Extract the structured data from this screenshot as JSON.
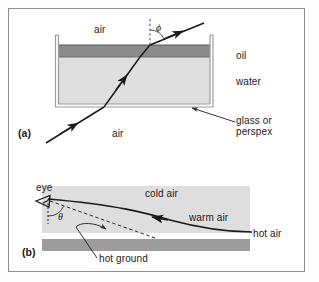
{
  "figure": {
    "panels": [
      {
        "id": "a",
        "panel_label": "(a)",
        "title_hidden": "",
        "labels": {
          "air_top": "air",
          "air_bottom": "air",
          "oil": "oil",
          "water": "water",
          "vessel": "glass or\nperspex",
          "vessel_line1": "glass or",
          "vessel_line2": "perspex",
          "angle": "ϕ"
        },
        "colors": {
          "oil_fill": "#8a8a8a",
          "water_fill": "#dcdcdc",
          "vessel_wall": "#b0b0b0",
          "ray": "#1a1a1a",
          "normal_dash": "#4a4a4a"
        }
      },
      {
        "id": "b",
        "panel_label": "(b)",
        "labels": {
          "eye": "eye",
          "cold_air": "cold air",
          "warm_air": "warm air",
          "hot_air": "hot air",
          "hot_ground": "hot ground",
          "angle": "θ"
        },
        "colors": {
          "cold_air_fill": "#dcdcdc",
          "ground_fill": "#9a9a9a",
          "ray": "#1a1a1a",
          "dashed_ray": "#2a2a2a"
        }
      }
    ],
    "frame": {
      "border_color": "#8d8d8d",
      "background": "#ffffff"
    }
  }
}
